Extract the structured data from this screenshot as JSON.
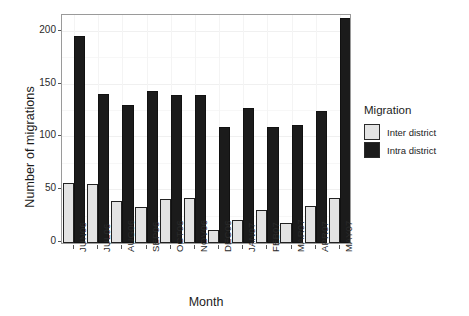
{
  "chart_data": {
    "type": "bar",
    "title": "",
    "xlabel": "Month",
    "ylabel": "Number of migrations",
    "categories": [
      "JUN06",
      "JUL06",
      "AUG06",
      "SEP06",
      "OCT06",
      "NOV06",
      "DEC06",
      "JAN07",
      "FEB07",
      "MAR07",
      "APR07",
      "MAY07"
    ],
    "series": [
      {
        "name": "Inter district",
        "color": "#e3e3e3",
        "values": [
          56,
          55,
          39,
          33,
          41,
          42,
          11,
          21,
          30,
          18,
          34,
          42
        ]
      },
      {
        "name": "Intra district",
        "color": "#1b1b1b",
        "values": [
          195,
          140,
          130,
          143,
          139,
          139,
          109,
          127,
          109,
          111,
          124,
          212
        ]
      }
    ],
    "ylim": [
      0,
      215
    ],
    "yticks": [
      0,
      50,
      100,
      150,
      200
    ],
    "ytick_labels": [
      "0",
      "50",
      "100",
      "150",
      "200"
    ],
    "grid": true,
    "legend_position": "right",
    "legend_title": "Migration"
  },
  "axes": {
    "y_title": "Number of migrations",
    "x_title": "Month"
  },
  "legend": {
    "title": "Migration",
    "entries": [
      {
        "label": "Inter district",
        "swatch": "#e3e3e3"
      },
      {
        "label": "Intra district",
        "swatch": "#1b1b1b"
      }
    ]
  }
}
